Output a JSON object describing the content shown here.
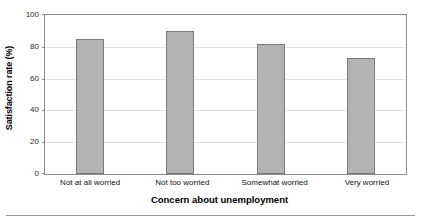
{
  "chart_data": {
    "type": "bar",
    "title": "",
    "categories": [
      "Not at all worried",
      "Not too worried",
      "Somewhat worried",
      "Very worried"
    ],
    "values": [
      85,
      90,
      82,
      73
    ],
    "series": [
      {
        "name": "Satisfaction rate",
        "values": [
          85,
          90,
          82,
          73
        ]
      }
    ],
    "xlabel": "Concern about unemployment",
    "ylabel": "Satisfaction rate (%)",
    "ylim": [
      0,
      100
    ],
    "yticks": [
      0,
      20,
      40,
      60,
      80,
      100
    ],
    "ytick_labels": [
      "0",
      "20",
      "40",
      "60",
      "80",
      "100"
    ],
    "grid": true,
    "grid_axis": "y",
    "legend": false,
    "bar_fill_color": "#b3b3b3",
    "bar_edge_color": "#7a7a7a",
    "gridline_color": "#e3e3e3",
    "axis_color": "#8c8c8c"
  }
}
